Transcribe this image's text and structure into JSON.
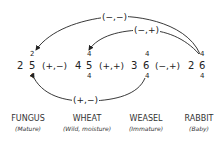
{
  "organisms": [
    {
      "name": "FUNGUS",
      "state": "(Mature)",
      "left": "2",
      "right": "5",
      "top": "2",
      "bottom": "4"
    },
    {
      "name": "WHEAT",
      "state": "(Wild, moisture)",
      "left": "4",
      "right": "5",
      "top": "4",
      "bottom": "4"
    },
    {
      "name": "WEASEL",
      "state": "(Immature)",
      "left": "3",
      "right": "6",
      "top": "4",
      "bottom": "4"
    },
    {
      "name": "RABBIT",
      "state": "(Baby)",
      "left": "2",
      "right": "6",
      "top": "4",
      "bottom": "4"
    }
  ],
  "adjacent_relations": [
    "(+,−)",
    "(+,+)",
    "(−,+)"
  ],
  "arrows": [
    {
      "label": "(−,−)",
      "from": "RABBIT",
      "to": "FUNGUS"
    },
    {
      "label": "(−,+)",
      "from": "RABBIT",
      "to": "WHEAT"
    },
    {
      "label": "(+,−)",
      "from": "WEASEL",
      "to": "FUNGUS",
      "both_ends": true
    }
  ]
}
